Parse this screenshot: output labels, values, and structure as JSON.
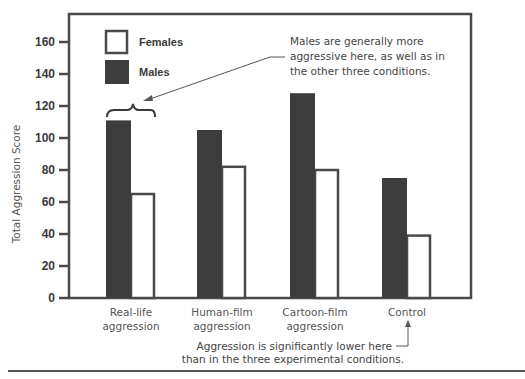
{
  "chart_data": {
    "type": "bar",
    "title": "",
    "xlabel": "",
    "ylabel": "Total Aggression Score",
    "ylim": [
      0,
      170
    ],
    "yticks": [
      0,
      20,
      40,
      60,
      80,
      100,
      120,
      140,
      160
    ],
    "grid": false,
    "legend_position": "top-left",
    "categories": [
      [
        "Real-life",
        "aggression"
      ],
      [
        "Human-film",
        "aggression"
      ],
      [
        "Cartoon-film",
        "aggression"
      ],
      [
        "Control"
      ]
    ],
    "series": [
      {
        "name": "Males",
        "color": "#3d3d3d",
        "style": "filled",
        "values": [
          111,
          105,
          128,
          75
        ]
      },
      {
        "name": "Females",
        "color": "#ffffff",
        "style": "outline",
        "values": [
          65,
          82,
          80,
          39
        ]
      }
    ],
    "legend": [
      "Females",
      "Males"
    ],
    "annotations": [
      {
        "id": "males-note",
        "lines": [
          "Males are generally more",
          "aggressive here, as well as in",
          "the other three conditions."
        ],
        "target": "Real-life aggression (brace over bars)"
      },
      {
        "id": "control-note",
        "lines": [
          "Aggression is significantly lower here",
          "than in the three experimental conditions."
        ],
        "target": "Control"
      }
    ]
  }
}
